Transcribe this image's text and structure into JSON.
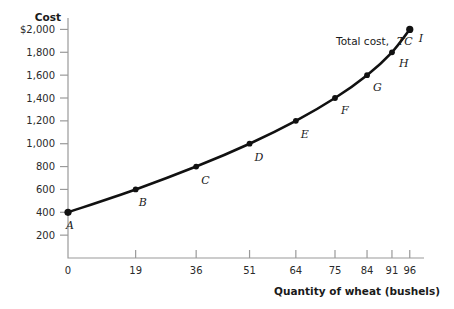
{
  "chart_data": {
    "type": "line",
    "title": "",
    "xlabel": "Quantity of wheat (bushels)",
    "ylabel": "Cost",
    "xlim": [
      0,
      100
    ],
    "ylim": [
      0,
      2100
    ],
    "grid": false,
    "legend_position": "inline-annotation",
    "series_label": "Total cost, TC",
    "series_label_plain": "Total cost,",
    "series_label_italic": "TC",
    "x": [
      0,
      19,
      36,
      51,
      64,
      75,
      84,
      91,
      96
    ],
    "values": [
      400,
      600,
      800,
      1000,
      1200,
      1400,
      1600,
      1800,
      2000
    ],
    "point_labels": [
      "A",
      "B",
      "C",
      "D",
      "E",
      "F",
      "G",
      "H",
      "I"
    ],
    "xticks": [
      "0",
      "19",
      "36",
      "51",
      "64",
      "75",
      "84",
      "91",
      "96"
    ],
    "xtick_values": [
      0,
      19,
      36,
      51,
      64,
      75,
      84,
      91,
      96
    ],
    "yticks": [
      "200",
      "400",
      "600",
      "800",
      "1,000",
      "1,200",
      "1,400",
      "1,600",
      "1,800",
      "$2,000"
    ],
    "ytick_values": [
      200,
      400,
      600,
      800,
      1000,
      1200,
      1400,
      1600,
      1800,
      2000
    ],
    "colors": {
      "background": "#ffffff",
      "curve": "#111111",
      "axis": "#9a9a9a",
      "text": "#1a1a1a"
    }
  }
}
